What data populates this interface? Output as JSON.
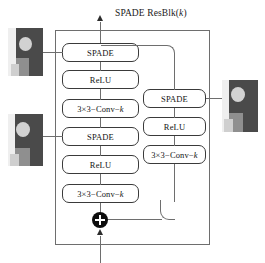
{
  "diagram": {
    "title_main": "SPADE ResBlk(",
    "title_param": "k",
    "title_close": ")",
    "title_full": "SPADE ResBlk(k)",
    "type": "neural-network-block-diagram"
  },
  "left_branch": {
    "name": "main-branch",
    "blocks": [
      {
        "label": "SPADE",
        "kind": "spade"
      },
      {
        "label": "ReLU",
        "kind": "relu"
      },
      {
        "label_prefix": "3×3−Conv−",
        "label_param": "k",
        "kind": "conv"
      },
      {
        "label": "SPADE",
        "kind": "spade"
      },
      {
        "label": "ReLU",
        "kind": "relu"
      },
      {
        "label_prefix": "3×3−Conv−",
        "label_param": "k",
        "kind": "conv"
      }
    ]
  },
  "right_branch": {
    "name": "skip-branch",
    "blocks": [
      {
        "label": "SPADE",
        "kind": "spade"
      },
      {
        "label": "ReLU",
        "kind": "relu"
      },
      {
        "label_prefix": "3×3−Conv−",
        "label_param": "k",
        "kind": "conv"
      }
    ]
  },
  "nodes": {
    "sum_symbol": "+",
    "sum_name": "element-wise-addition"
  },
  "thumbnails": [
    {
      "name": "segmentation-map-top-left",
      "alt": "segmentation map"
    },
    {
      "name": "segmentation-map-bottom-left",
      "alt": "segmentation map"
    },
    {
      "name": "segmentation-map-right",
      "alt": "segmentation map"
    }
  ],
  "colors": {
    "frame": "#6e6e6e",
    "box_border": "#3a3a3a",
    "text": "#141414",
    "node": "#0d0d0d",
    "background": "#ffffff"
  }
}
